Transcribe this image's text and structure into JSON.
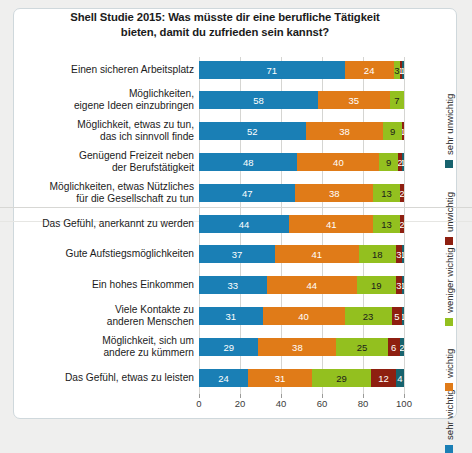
{
  "title": "Shell Studie 2015: Was müsste dir eine berufliche Tätigkeit bieten, damit du zufrieden sein kannst?",
  "legend": {
    "items": [
      {
        "label": "sehr wichtig",
        "color": "#1a7fb5"
      },
      {
        "label": "wichtig",
        "color": "#e07b18"
      },
      {
        "label": "weniger wichtig",
        "color": "#93c01f"
      },
      {
        "label": "unwichtig",
        "color": "#8e1f10"
      },
      {
        "label": "sehr unwichtig",
        "color": "#17636e"
      }
    ]
  },
  "axis": {
    "ticks": [
      "0",
      "20",
      "40",
      "60",
      "80",
      "100"
    ]
  },
  "chart_data": {
    "type": "bar",
    "orientation": "horizontal",
    "stacked": true,
    "title": "Shell Studie 2015: Was müsste dir eine berufliche Tätigkeit bieten, damit du zufrieden sein kannst?",
    "xlabel": "",
    "ylabel": "",
    "xlim": [
      0,
      100
    ],
    "grid": true,
    "legend_position": "right",
    "categories": [
      "Einen sicheren Arbeitsplatz",
      "Möglichkeiten, eigene Ideen einzubringen",
      "Möglichkeit, etwas zu tun, das ich sinnvoll finde",
      "Genügend Freizeit neben der Berufstätigkeit",
      "Möglichkeiten, etwas Nützliches für die Gesellschaft zu tun",
      "Das Gefühl, anerkannt zu werden",
      "Gute Aufstiegsmöglichkeiten",
      "Ein hohes Einkommen",
      "Viele Kontakte zu anderen Menschen",
      "Möglichkeit, sich um andere zu kümmern",
      "Das Gefühl, etwas zu leisten"
    ],
    "category_lines": [
      [
        "Einen sicheren Arbeitsplatz"
      ],
      [
        "Möglichkeiten,",
        "eigene Ideen einzubringen"
      ],
      [
        "Möglichkeit, etwas zu tun,",
        "das ich sinnvoll finde"
      ],
      [
        "Genügend Freizeit neben",
        "der Berufstätigkeit"
      ],
      [
        "Möglichkeiten, etwas Nützliches",
        "für die Gesellschaft zu tun"
      ],
      [
        "Das Gefühl, anerkannt zu werden"
      ],
      [
        "Gute Aufstiegsmöglichkeiten"
      ],
      [
        "Ein hohes Einkommen"
      ],
      [
        "Viele Kontakte zu",
        "anderen Menschen"
      ],
      [
        "Möglichkeit, sich um",
        "andere zu kümmern"
      ],
      [
        "Das Gefühl, etwas zu leisten"
      ]
    ],
    "series": [
      {
        "name": "sehr wichtig",
        "color": "#1a7fb5",
        "values": [
          71,
          58,
          52,
          48,
          47,
          44,
          37,
          33,
          31,
          29,
          24
        ]
      },
      {
        "name": "wichtig",
        "color": "#e07b18",
        "values": [
          24,
          35,
          38,
          40,
          38,
          41,
          41,
          44,
          40,
          38,
          31
        ]
      },
      {
        "name": "weniger wichtig",
        "color": "#93c01f",
        "values": [
          3,
          7,
          9,
          9,
          13,
          13,
          18,
          19,
          23,
          25,
          29
        ]
      },
      {
        "name": "unwichtig",
        "color": "#8e1f10",
        "values": [
          1,
          0,
          1,
          2,
          2,
          2,
          3,
          3,
          5,
          6,
          12
        ]
      },
      {
        "name": "sehr unwichtig",
        "color": "#17636e",
        "values": [
          1,
          0,
          0,
          1,
          0,
          0,
          1,
          1,
          1,
          2,
          4
        ]
      }
    ]
  }
}
